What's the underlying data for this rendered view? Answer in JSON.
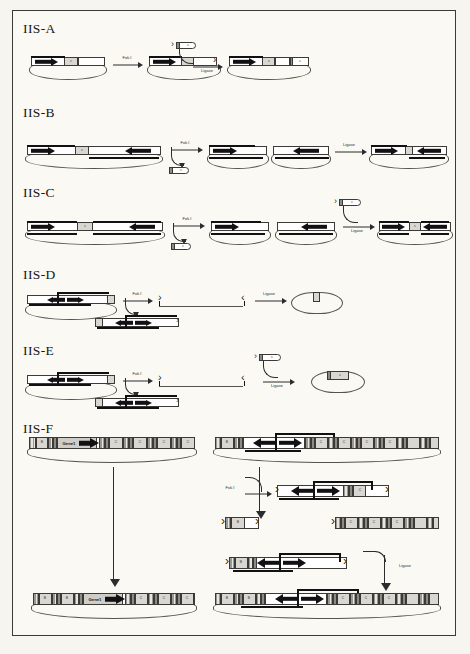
{
  "figure": {
    "background_color": "#faf9f4",
    "border_color": "#3a3a38",
    "ink_color": "#17171a"
  },
  "panels": [
    {
      "id": "IIS-A",
      "label": "IIS-A",
      "description": "Single-insert plasmid cut by Fok I then ligated with an adaptor cassette",
      "reaction_arrows": [
        {
          "label": "Fok I"
        },
        {
          "label": "Ligase"
        }
      ],
      "stages": [
        {
          "name": "starting-plasmid",
          "shape": "plasmid",
          "segments": [
            "black-arrow-gene",
            "grey-spacer",
            "white-cassette"
          ]
        },
        {
          "name": "cut-plasmid",
          "shape": "plasmid",
          "segments": [
            "black-arrow-gene",
            "grey-spacer",
            "open-overhang-end"
          ]
        },
        {
          "name": "donor-fragment",
          "shape": "linear-capsule",
          "segments": [
            "small-insert"
          ]
        },
        {
          "name": "ligated-plasmid",
          "shape": "plasmid",
          "segments": [
            "black-arrow-gene",
            "grey-spacer",
            "white-cassette",
            "new-insert"
          ]
        }
      ]
    },
    {
      "id": "IIS-B",
      "label": "IIS-B",
      "description": "Two convergent genes on one plasmid; Fok I release of a fragment, then Ligase re-assembly",
      "reaction_arrows": [
        {
          "label": "Fok I"
        },
        {
          "label": "Ligase"
        }
      ],
      "stages": [
        {
          "name": "starting-plasmid",
          "shape": "plasmid",
          "segments": [
            "left-arrow-gene-right",
            "grey-spacer",
            "right-arrow-gene-left"
          ]
        },
        {
          "name": "released-fragment",
          "shape": "linear-capsule",
          "segments": [
            "small-insert"
          ]
        },
        {
          "name": "cut-plasmid-left",
          "shape": "plasmid",
          "segments": [
            "black-arrow-gene",
            "open-overhang-end"
          ]
        },
        {
          "name": "cut-plasmid-right",
          "shape": "plasmid",
          "segments": [
            "open-overhang-end",
            "black-arrow-gene-left"
          ]
        },
        {
          "name": "ligated-plasmid",
          "shape": "plasmid",
          "segments": [
            "black-arrow-gene",
            "junction",
            "black-arrow-gene-left"
          ]
        }
      ]
    },
    {
      "id": "IIS-C",
      "label": "IIS-C",
      "description": "Convergent-gene plasmid, Fok I excision of a central spacer and Ligase-mediated re-insertion",
      "reaction_arrows": [
        {
          "label": "Fok I"
        },
        {
          "label": "Ligase"
        }
      ],
      "stages": [
        {
          "name": "starting-plasmid",
          "shape": "plasmid",
          "segments": [
            "black-arrow-gene",
            "grey-spacer",
            "black-arrow-gene-left"
          ]
        },
        {
          "name": "excised-spacer",
          "shape": "linear-capsule",
          "segments": [
            "small-insert"
          ]
        },
        {
          "name": "donor-cassette",
          "shape": "linear-capsule",
          "segments": [
            "small-insert"
          ]
        },
        {
          "name": "cut-plasmid-left",
          "shape": "plasmid",
          "segments": [
            "black-arrow-gene",
            "open-overhang-end"
          ]
        },
        {
          "name": "cut-plasmid-right",
          "shape": "plasmid",
          "segments": [
            "open-overhang-end",
            "black-arrow-gene-left"
          ]
        },
        {
          "name": "ligated-plasmid",
          "shape": "plasmid",
          "segments": [
            "black-arrow-gene",
            "grey-spacer",
            "black-arrow-gene-left"
          ]
        }
      ]
    },
    {
      "id": "IIS-D",
      "label": "IIS-D",
      "description": "Plasmid with inverted-repeat cassette cut by Fok I; linear intermediates re-circularised by Ligase to a minimal plasmid",
      "reaction_arrows": [
        {
          "label": "Fok I"
        },
        {
          "label": "Ligase"
        }
      ],
      "stages": [
        {
          "name": "starting-plasmid",
          "shape": "plasmid",
          "segments": [
            "white-cassette",
            "double-headed-arrow",
            "white-cassette"
          ]
        },
        {
          "name": "linear-intermediate",
          "shape": "linear",
          "segments": [
            "white-cassette",
            "double-headed-arrow",
            "white-cassette"
          ]
        },
        {
          "name": "free-end-left",
          "shape": "open-end"
        },
        {
          "name": "free-end-right",
          "shape": "open-end"
        },
        {
          "name": "product-plasmid",
          "shape": "plasmid",
          "segments": [
            "small-insert"
          ]
        }
      ]
    },
    {
      "id": "IIS-E",
      "label": "IIS-E",
      "description": "As IIS-D but an extra donor cassette is supplied before ligation, giving a plasmid carrying the new insert",
      "reaction_arrows": [
        {
          "label": "Fok I"
        },
        {
          "label": "Ligase"
        }
      ],
      "stages": [
        {
          "name": "starting-plasmid",
          "shape": "plasmid",
          "segments": [
            "white-cassette",
            "double-headed-arrow",
            "white-cassette"
          ]
        },
        {
          "name": "linear-intermediate",
          "shape": "linear",
          "segments": [
            "white-cassette",
            "double-headed-arrow",
            "white-cassette"
          ]
        },
        {
          "name": "free-end-left",
          "shape": "open-end"
        },
        {
          "name": "free-end-right",
          "shape": "open-end"
        },
        {
          "name": "donor-cassette",
          "shape": "linear-capsule",
          "segments": [
            "small-insert"
          ]
        },
        {
          "name": "product-plasmid",
          "shape": "plasmid",
          "segments": [
            "grey-insert"
          ]
        }
      ]
    },
    {
      "id": "IIS-F",
      "label": "IIS-F",
      "description": "Full array assembly: a multi-cassette plasmid carrying a gene is rebuilt by Fok I digestion and Ligase joining of sub-fragments",
      "reaction_arrows": [
        {
          "label": "Fok I"
        },
        {
          "label": "Ligase"
        }
      ],
      "left_column": [
        {
          "name": "input-array-plasmid",
          "shape": "plasmid-array",
          "cells": [
            "B",
            "",
            "gene",
            "",
            "C",
            "",
            "C",
            "",
            "C",
            "",
            "C"
          ],
          "gene_label": "Gene1"
        },
        {
          "name": "output-array-plasmid",
          "shape": "plasmid-array",
          "cells": [
            "B",
            "",
            "B",
            "",
            "gene",
            "",
            "C",
            "",
            "C",
            "",
            "C"
          ],
          "gene_label": "Gene1"
        }
      ],
      "right_column": [
        {
          "name": "template-array-plasmid",
          "shape": "plasmid-array",
          "cells": [
            "B",
            "",
            "",
            "",
            "C",
            "",
            "C",
            "",
            "C",
            "",
            "C"
          ],
          "has_double_arrow": true
        },
        {
          "name": "fok-digest-fragment",
          "shape": "linear-array",
          "cells": [
            "",
            "",
            "C"
          ],
          "has_double_arrow": true
        },
        {
          "name": "small-fragment-left",
          "shape": "linear-array",
          "cells": [
            "B"
          ]
        },
        {
          "name": "small-fragment-right",
          "shape": "linear-array",
          "cells": [
            "C",
            "C",
            "C"
          ]
        },
        {
          "name": "ligation-substrate",
          "shape": "linear-array",
          "cells": [
            "B",
            "",
            "",
            "C"
          ],
          "has_double_arrow": true
        },
        {
          "name": "final-array-plasmid",
          "shape": "plasmid-array",
          "cells": [
            "B",
            "",
            "B",
            "",
            "",
            "",
            "C",
            "",
            "C",
            "",
            "C"
          ],
          "has_double_arrow": true
        }
      ]
    }
  ]
}
